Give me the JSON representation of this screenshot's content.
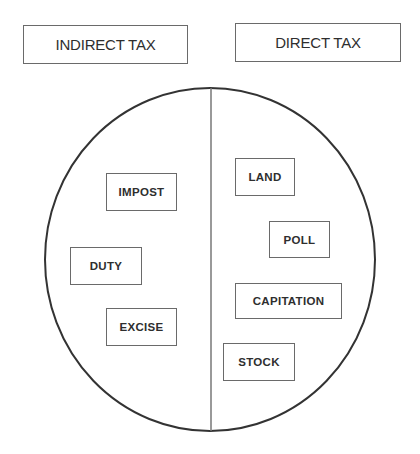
{
  "diagram": {
    "categories": [
      {
        "label": "INDIRECT TAX",
        "side": "left",
        "items": [
          "IMPOST",
          "DUTY",
          "EXCISE"
        ]
      },
      {
        "label": "DIRECT TAX",
        "side": "right",
        "items": [
          "LAND",
          "POLL",
          "CAPITATION",
          "STOCK"
        ]
      }
    ],
    "colors": {
      "circle_stroke": "#333333",
      "divider_stroke": "#777777",
      "box_border": "#6a6a6a",
      "text": "#2e2e2e",
      "background": "#ffffff"
    }
  }
}
